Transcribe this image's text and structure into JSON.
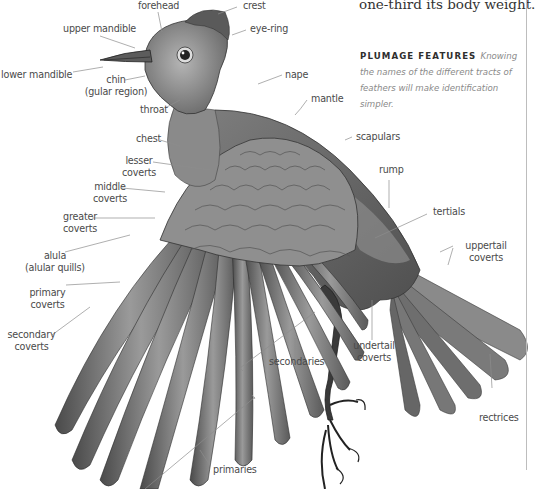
{
  "intro_text": "one-third its body weight.",
  "feature_box": {
    "heading": "PLUMAGE FEATURES",
    "body": "Knowing the names of the different tracts of feathers will make identification simpler."
  },
  "labels": {
    "forehead": "forehead",
    "crest": "crest",
    "upper_mandible": "upper mandible",
    "eye_ring": "eye-ring",
    "lower_mandible": "lower mandible",
    "chin_1": "chin",
    "chin_2": "(gular region)",
    "nape": "nape",
    "throat": "throat",
    "mantle": "mantle",
    "chest": "chest",
    "scapulars": "scapulars",
    "lesser_coverts_1": "lesser",
    "lesser_coverts_2": "coverts",
    "middle_coverts_1": "middle",
    "middle_coverts_2": "coverts",
    "rump": "rump",
    "greater_coverts_1": "greater",
    "greater_coverts_2": "coverts",
    "tertials": "tertials",
    "alula_1": "alula",
    "alula_2": "(alular quills)",
    "uppertail_coverts_1": "uppertail",
    "uppertail_coverts_2": "coverts",
    "primary_coverts_1": "primary",
    "primary_coverts_2": "coverts",
    "secondary_coverts_1": "secondary",
    "secondary_coverts_2": "coverts",
    "secondaries": "secondaries",
    "undertail_coverts_1": "undertail",
    "undertail_coverts_2": "coverts",
    "rectrices": "rectrices",
    "primaries": "primaries"
  },
  "colors": {
    "label_text": "#4a4a4a",
    "leader_line": "#8c8c8c",
    "heading": "#2e2e2e",
    "body_italic": "#8a8a8a"
  }
}
